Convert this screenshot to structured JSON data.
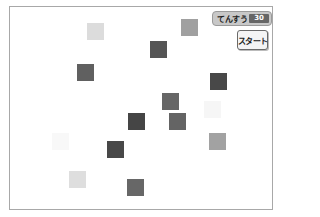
{
  "monitor": {
    "label": "てんすう",
    "value": "30"
  },
  "start_button": {
    "label": "スタート"
  },
  "squares": [
    {
      "x": 87,
      "y": 23,
      "color": "#dcdcdc"
    },
    {
      "x": 181,
      "y": 19,
      "color": "#a0a0a0"
    },
    {
      "x": 150,
      "y": 41,
      "color": "#555555"
    },
    {
      "x": 77,
      "y": 64,
      "color": "#606060"
    },
    {
      "x": 210,
      "y": 73,
      "color": "#484848"
    },
    {
      "x": 162,
      "y": 93,
      "color": "#666666"
    },
    {
      "x": 204,
      "y": 101,
      "color": "#f6f6f6"
    },
    {
      "x": 128,
      "y": 113,
      "color": "#454545"
    },
    {
      "x": 169,
      "y": 113,
      "color": "#646464"
    },
    {
      "x": 52,
      "y": 133,
      "color": "#f8f8f8"
    },
    {
      "x": 107,
      "y": 141,
      "color": "#484848"
    },
    {
      "x": 209,
      "y": 133,
      "color": "#a2a2a2"
    },
    {
      "x": 69,
      "y": 171,
      "color": "#dedede"
    },
    {
      "x": 127,
      "y": 179,
      "color": "#676767"
    }
  ]
}
